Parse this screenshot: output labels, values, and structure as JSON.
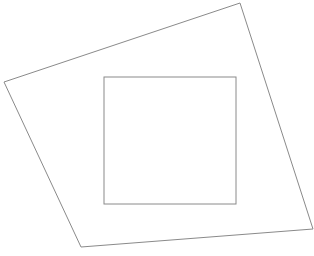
{
  "canvas": {
    "width": 314,
    "height": 256,
    "background": "#ffffff"
  },
  "stroke": {
    "color": "#8a8a8a",
    "width": 1
  },
  "shapes": {
    "outer_quadrilateral": {
      "points": "4,82 240,3 313,229 81,247"
    },
    "inner_rectangle": {
      "x": 104,
      "y": 77,
      "width": 132,
      "height": 127
    }
  }
}
